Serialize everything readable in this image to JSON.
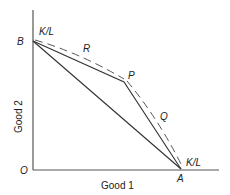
{
  "diagram": {
    "axes": {
      "x_label": "Good 1",
      "y_label": "Good 2",
      "origin_label": "O"
    },
    "points": {
      "B": {
        "label": "B",
        "ratio_label": "K/L"
      },
      "P": {
        "label": "P"
      },
      "A": {
        "label": "A",
        "ratio_label": "K/L"
      }
    },
    "curves": {
      "R": {
        "label": "R",
        "style": "dashed"
      },
      "Q": {
        "label": "Q",
        "style": "dashed"
      }
    },
    "colors": {
      "line": "#333333",
      "axis": "#555555",
      "background": "#ffffff"
    }
  }
}
